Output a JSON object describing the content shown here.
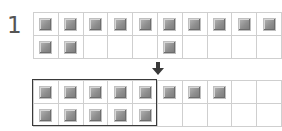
{
  "step": {
    "label": "1"
  },
  "colors": {
    "grid_line": "#cfcfcf",
    "block_fill": "#8e8e8e",
    "outline": "#3a3a3a",
    "arrow": "#3a3a3a",
    "step_label": "#555555"
  },
  "icons": {
    "arrow": "down-arrow"
  },
  "top_grid": {
    "columns": 10,
    "rows": 2,
    "filled": [
      [
        1,
        1,
        1,
        1,
        1,
        1,
        1,
        1,
        1,
        1
      ],
      [
        1,
        1,
        0,
        0,
        0,
        1,
        0,
        0,
        0,
        0
      ]
    ],
    "filled_count": 13
  },
  "bottom_grid": {
    "columns": 10,
    "rows": 2,
    "filled": [
      [
        1,
        1,
        1,
        1,
        1,
        1,
        1,
        1,
        0,
        0
      ],
      [
        1,
        1,
        1,
        1,
        1,
        0,
        0,
        0,
        0,
        0
      ]
    ],
    "filled_count": 13,
    "highlighted_group": {
      "columns": 5,
      "rows": 2,
      "count": 10
    }
  }
}
